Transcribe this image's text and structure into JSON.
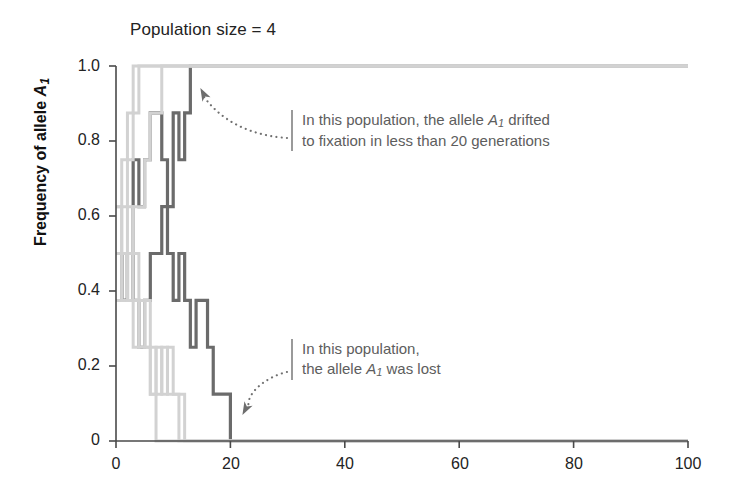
{
  "chart_data": {
    "type": "line",
    "title": "Population size = 4",
    "xlabel": "",
    "ylabel": "Frequency of allele A1",
    "ylabel_base": "Frequency of allele ",
    "ylabel_allele": "A",
    "ylabel_allele_sub": "1",
    "xlim": [
      0,
      100
    ],
    "ylim": [
      0,
      1
    ],
    "xticks": [
      0,
      20,
      40,
      60,
      80,
      100
    ],
    "xtick_labels": [
      "0",
      "20",
      "40",
      "60",
      "80",
      "100"
    ],
    "yticks": [
      0,
      0.2,
      0.4,
      0.6,
      0.8,
      1
    ],
    "ytick_labels": [
      "0",
      "0.2",
      "0.4",
      "0.6",
      "0.8",
      "1.0"
    ],
    "grid": false,
    "legend": "none",
    "step_style": "post",
    "series": [
      {
        "name": "population-fixed-dark",
        "color": "#6b6b6b",
        "width": 3.2,
        "outcome": "fixation",
        "x": [
          0,
          1,
          2,
          3,
          4,
          5,
          6,
          7,
          8,
          9,
          10,
          11,
          12,
          13,
          14,
          20,
          40,
          60,
          80,
          100
        ],
        "values": [
          0.5,
          0.375,
          0.5,
          0.75,
          0.625,
          0.75,
          0.875,
          0.875,
          0.75,
          0.625,
          0.875,
          0.75,
          0.875,
          1.0,
          1.0,
          1.0,
          1.0,
          1.0,
          1.0,
          1.0
        ]
      },
      {
        "name": "population-lost-dark",
        "color": "#6b6b6b",
        "width": 3.2,
        "outcome": "loss",
        "x": [
          0,
          1,
          2,
          3,
          4,
          5,
          6,
          7,
          8,
          9,
          10,
          11,
          12,
          13,
          14,
          15,
          16,
          17,
          18,
          19,
          20,
          40,
          60,
          80,
          100
        ],
        "values": [
          0.5,
          0.375,
          0.5,
          0.375,
          0.25,
          0.375,
          0.5,
          0.5,
          0.625,
          0.5,
          0.375,
          0.5,
          0.375,
          0.25,
          0.375,
          0.375,
          0.25,
          0.125,
          0.125,
          0.125,
          0.0,
          0.0,
          0.0,
          0.0,
          0.0
        ],
        "segments_note": "descends in steps to 0 at generation 20"
      },
      {
        "name": "population-light-1",
        "color": "#d2d2d2",
        "width": 3.0,
        "outcome": "fixation",
        "x": [
          0,
          1,
          2,
          3,
          4,
          5,
          100
        ],
        "values": [
          0.5,
          0.625,
          0.75,
          0.875,
          1.0,
          1.0,
          1.0
        ]
      },
      {
        "name": "population-light-2",
        "color": "#d2d2d2",
        "width": 3.0,
        "outcome": "fixation",
        "x": [
          0,
          1,
          2,
          3,
          100
        ],
        "values": [
          0.625,
          0.75,
          0.875,
          1.0,
          1.0
        ]
      },
      {
        "name": "population-light-3",
        "color": "#d2d2d2",
        "width": 3.0,
        "outcome": "fixation",
        "x": [
          0,
          1,
          2,
          3,
          4,
          5,
          6,
          7,
          8,
          100
        ],
        "values": [
          0.375,
          0.5,
          0.5,
          0.625,
          0.625,
          0.75,
          0.875,
          0.875,
          1.0,
          1.0
        ]
      },
      {
        "name": "population-light-4",
        "color": "#d2d2d2",
        "width": 3.0,
        "outcome": "loss",
        "x": [
          0,
          1,
          2,
          3,
          4,
          5,
          6,
          7,
          100
        ],
        "values": [
          0.5,
          0.375,
          0.5,
          0.375,
          0.25,
          0.25,
          0.125,
          0.0,
          0.0
        ]
      },
      {
        "name": "population-light-5",
        "color": "#d2d2d2",
        "width": 3.0,
        "outcome": "loss",
        "x": [
          0,
          1,
          2,
          3,
          4,
          5,
          6,
          7,
          8,
          9,
          10,
          11,
          12,
          100
        ],
        "values": [
          0.625,
          0.5,
          0.375,
          0.25,
          0.375,
          0.25,
          0.125,
          0.25,
          0.125,
          0.25,
          0.125,
          0.125,
          0.0,
          0.0
        ]
      },
      {
        "name": "population-light-6",
        "color": "#d2d2d2",
        "width": 3.0,
        "outcome": "loss",
        "x": [
          0,
          1,
          2,
          3,
          4,
          5,
          6,
          7,
          8,
          9,
          10,
          11,
          100
        ],
        "values": [
          0.5,
          0.5,
          0.625,
          0.5,
          0.375,
          0.375,
          0.25,
          0.125,
          0.25,
          0.125,
          0.125,
          0.0,
          0.0
        ]
      }
    ],
    "annotations": [
      {
        "id": "fixation",
        "line1_pre": "In this population, the allele ",
        "line1_allele": "A",
        "line1_sub": "1",
        "line1_post": " drifted",
        "line2": "to fixation in less than 20 generations",
        "points_to": "population-fixed-dark",
        "arrow_target_x": 13,
        "arrow_target_y": 1.0
      },
      {
        "id": "lost",
        "line1": "In this population,",
        "line2_pre": "the allele ",
        "line2_allele": "A",
        "line2_sub": "1",
        "line2_post": " was lost",
        "points_to": "population-lost-dark",
        "arrow_target_x": 20,
        "arrow_target_y": 0.0
      }
    ]
  },
  "colors": {
    "dark_trace": "#6b6b6b",
    "light_trace": "#d2d2d2",
    "axis": "#4a4a4a",
    "annotation_text": "#5d5d5d",
    "annotation_rule": "#9a9a9a",
    "title_text": "#232323",
    "background": "#ffffff"
  }
}
